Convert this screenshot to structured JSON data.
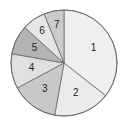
{
  "chart_data": {
    "type": "pie",
    "title": "",
    "start_angle_deg": 0,
    "direction": "clockwise",
    "categories": [
      "1",
      "2",
      "3",
      "4",
      "5",
      "6",
      "7"
    ],
    "values": [
      35.6,
      17.2,
      14.4,
      10.6,
      8.9,
      7.2,
      6.1
    ],
    "colors": [
      "#efefef",
      "#ebebeb",
      "#c8c8c8",
      "#e0e0e0",
      "#b4b4b4",
      "#e6e6e6",
      "#cbcbcb"
    ],
    "labels": [
      "1",
      "2",
      "3",
      "4",
      "5",
      "6",
      "7"
    ],
    "legend": "none"
  }
}
